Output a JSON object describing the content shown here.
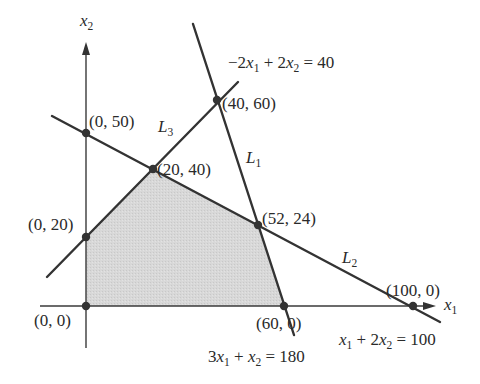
{
  "figure": {
    "width": 480,
    "height": 384,
    "colors": {
      "ink": "#333333",
      "text": "#2a2a2a",
      "feasible_fill": "#d6d6d6",
      "background": "#ffffff"
    },
    "axes": {
      "x": {
        "name": "x",
        "sub": "1",
        "from": [
          40,
          306
        ],
        "to": [
          436,
          306
        ],
        "label_pos": [
          444,
          310
        ]
      },
      "y": {
        "name": "x",
        "sub": "2",
        "from": [
          86,
          348
        ],
        "to": [
          86,
          42
        ],
        "label_pos": [
          80,
          26
        ]
      }
    },
    "feasible_region": {
      "vertices": [
        "(0, 0)",
        "(0, 20)",
        "(20, 40)",
        "(52, 24)",
        "(60, 0)"
      ],
      "polygon": [
        [
          86,
          306
        ],
        [
          86,
          237
        ],
        [
          153,
          169
        ],
        [
          258,
          225
        ],
        [
          284,
          306
        ]
      ]
    },
    "lines": [
      {
        "id": "L1",
        "name": "L",
        "sub": "1",
        "equation": "-2x1 + 2x2 = 40 (3x1 + x2 = 180 boundary)",
        "from": [
          193,
          24
        ],
        "to": [
          294,
          335
        ],
        "label_pos": [
          246,
          163
        ]
      },
      {
        "id": "L2",
        "name": "L",
        "sub": "2",
        "from": [
          52,
          116
        ],
        "to": [
          440,
          322
        ],
        "label_pos": [
          342,
          263
        ]
      },
      {
        "id": "L3",
        "name": "L",
        "sub": "3",
        "from": [
          47,
          277
        ],
        "to": [
          238,
          82
        ],
        "label_pos": [
          158,
          132
        ]
      }
    ],
    "points": [
      {
        "label": "(0, 0)",
        "pos": [
          86,
          306
        ],
        "label_pos": [
          34,
          326
        ]
      },
      {
        "label": "(0, 20)",
        "pos": [
          86,
          237
        ],
        "label_pos": [
          28,
          230
        ]
      },
      {
        "label": "(0, 50)",
        "pos": [
          86,
          133
        ],
        "label_pos": [
          89,
          127
        ]
      },
      {
        "label": "(20, 40)",
        "pos": [
          153,
          169
        ],
        "label_pos": [
          157,
          175
        ]
      },
      {
        "label": "(40, 60)",
        "pos": [
          217,
          100
        ],
        "label_pos": [
          222,
          109
        ]
      },
      {
        "label": "(52, 24)",
        "pos": [
          258,
          225
        ],
        "label_pos": [
          262,
          224
        ]
      },
      {
        "label": "(60, 0)",
        "pos": [
          284,
          306
        ],
        "label_pos": [
          256,
          329
        ]
      },
      {
        "label": "(100, 0)",
        "pos": [
          413,
          306
        ],
        "label_pos": [
          386,
          296
        ]
      }
    ],
    "equations": [
      {
        "id": "eq-top",
        "text": "−2x₁ + 2x₂ = 40",
        "parts": [
          "−2",
          "x",
          "1",
          " + 2",
          "x",
          "2",
          " = 40"
        ],
        "pos": [
          228,
          68
        ]
      },
      {
        "id": "eq-bottom-left",
        "text": "3x₁ + x₂ = 180",
        "parts": [
          "3",
          "x",
          "1",
          " + ",
          "x",
          "2",
          " = 180"
        ],
        "pos": [
          208,
          362
        ]
      },
      {
        "id": "eq-bottom-right",
        "text": "x₁ + 2x₂ = 100",
        "parts": [
          "",
          "x",
          "1",
          " + 2",
          "x",
          "2",
          " = 100"
        ],
        "pos": [
          339,
          345
        ]
      }
    ]
  }
}
